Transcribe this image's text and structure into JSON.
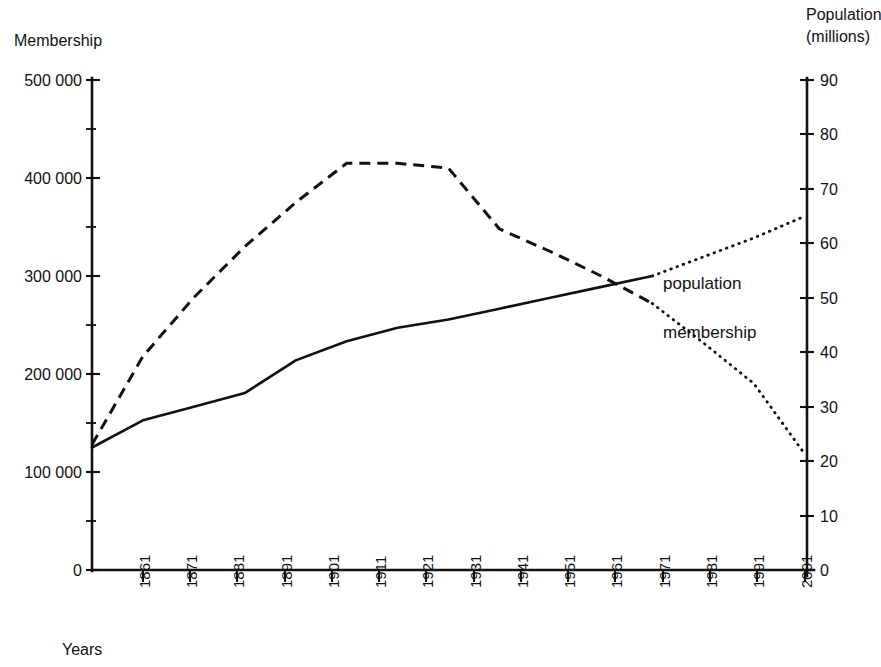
{
  "chart_data": {
    "type": "line",
    "title": "",
    "xlabel": "Years",
    "ylabel": "Membership",
    "y2label": "Population (millions)",
    "grid": false,
    "legend_position": "inline-annotations",
    "x": [
      1861,
      1871,
      1881,
      1891,
      1901,
      1911,
      1921,
      1931,
      1941,
      1951,
      1961,
      1971,
      1981,
      1991,
      2001
    ],
    "xtick_labels": [
      "1861",
      "1871",
      "1881",
      "1891",
      "1901",
      "1911",
      "1921",
      "1931",
      "1941",
      "1951",
      "1961",
      "1971",
      "1981",
      "1991",
      "2001"
    ],
    "xlim": [
      1861,
      2001
    ],
    "ylim": [
      0,
      500000
    ],
    "ytick_labels": [
      "0",
      "100 000",
      "200 000",
      "300 000",
      "400 000",
      "500 000"
    ],
    "ytick_values": [
      0,
      100000,
      200000,
      300000,
      400000,
      500000
    ],
    "y_minor_step": 50000,
    "y2lim": [
      0,
      90
    ],
    "y2tick_labels": [
      "0",
      "10",
      "20",
      "30",
      "40",
      "50",
      "60",
      "70",
      "80",
      "90"
    ],
    "y2tick_values": [
      0,
      10,
      20,
      30,
      40,
      50,
      60,
      70,
      80,
      90
    ],
    "series": [
      {
        "name": "population",
        "label": "population",
        "axis": "right",
        "units": "millions",
        "style": "solid",
        "x": [
          1861,
          1871,
          1881,
          1891,
          1901,
          1911,
          1921,
          1931,
          1941,
          1951,
          1961,
          1971
        ],
        "values": [
          22.5,
          27.5,
          30.0,
          32.5,
          38.5,
          42.0,
          44.5,
          46.0,
          48.0,
          50.0,
          52.0,
          54.0
        ],
        "projection_style": "dotted",
        "projection_x": [
          1971,
          1981,
          1991,
          2001
        ],
        "projection_values": [
          54.0,
          57.5,
          61.0,
          65.0
        ]
      },
      {
        "name": "membership",
        "label": "membership",
        "axis": "left",
        "units": "members",
        "style": "dashed",
        "x": [
          1861,
          1871,
          1881,
          1891,
          1901,
          1911,
          1921,
          1931,
          1941,
          1951,
          1961,
          1971
        ],
        "values": [
          128000,
          218000,
          278000,
          330000,
          375000,
          415000,
          415000,
          410000,
          348000,
          325000,
          300000,
          272000
        ],
        "projection_style": "dotted",
        "projection_x": [
          1971,
          1981,
          1991,
          2001
        ],
        "projection_values": [
          272000,
          232000,
          190000,
          118000
        ]
      }
    ],
    "annotations": [
      {
        "name": "population-label",
        "text": "population",
        "x": 1971,
        "y_hint": "upper"
      },
      {
        "name": "membership-label",
        "text": "membership",
        "x": 1971,
        "y_hint": "lower"
      }
    ]
  },
  "labels": {
    "y_axis_title": "Membership",
    "y2_axis_title_line1": "Population",
    "y2_axis_title_line2": "(millions)",
    "x_axis_title": "Years",
    "series_population": "population",
    "series_membership": "membership"
  },
  "ytick_labels": {
    "t0": "0",
    "t1": "100 000",
    "t2": "200 000",
    "t3": "300 000",
    "t4": "400 000",
    "t5": "500 000"
  },
  "y2tick_labels": {
    "t0": "0",
    "t1": "10",
    "t2": "20",
    "t3": "30",
    "t4": "40",
    "t5": "50",
    "t6": "60",
    "t7": "70",
    "t8": "80",
    "t9": "90"
  },
  "xtick_labels": {
    "t0": "1861",
    "t1": "1871",
    "t2": "1881",
    "t3": "1891",
    "t4": "1901",
    "t5": "1911",
    "t6": "1921",
    "t7": "1931",
    "t8": "1941",
    "t9": "1951",
    "t10": "1961",
    "t11": "1971",
    "t12": "1981",
    "t13": "1991",
    "t14": "2001"
  },
  "colors": {
    "ink": "#111111",
    "background": "#ffffff"
  }
}
